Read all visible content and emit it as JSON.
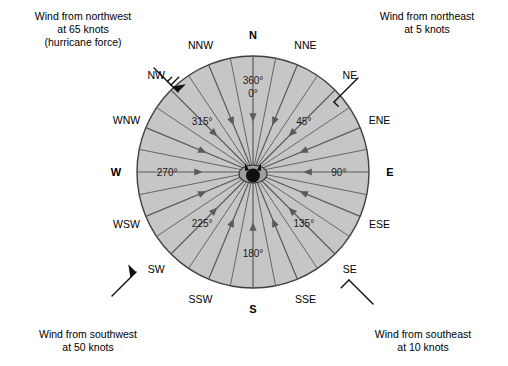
{
  "figure": {
    "kind": "wind-rose-diagram",
    "background_color": "#ffffff",
    "circle_fill_color": "#c6c6c6",
    "circle_edge_color": "#3f3f3f",
    "spoke_color": "#5a5a5a",
    "text_color": "#000000"
  },
  "rose": {
    "center_x": 253,
    "center_y": 172,
    "radius": 116,
    "compass_points": [
      {
        "label": "N",
        "bearing": 0,
        "cardinal": true
      },
      {
        "label": "NNE",
        "bearing": 22.5,
        "cardinal": false
      },
      {
        "label": "NE",
        "bearing": 45,
        "cardinal": false
      },
      {
        "label": "ENE",
        "bearing": 67.5,
        "cardinal": false
      },
      {
        "label": "E",
        "bearing": 90,
        "cardinal": true
      },
      {
        "label": "ESE",
        "bearing": 112.5,
        "cardinal": false
      },
      {
        "label": "SE",
        "bearing": 135,
        "cardinal": false
      },
      {
        "label": "SSE",
        "bearing": 157.5,
        "cardinal": false
      },
      {
        "label": "S",
        "bearing": 180,
        "cardinal": true
      },
      {
        "label": "SSW",
        "bearing": 202.5,
        "cardinal": false
      },
      {
        "label": "SW",
        "bearing": 225,
        "cardinal": false
      },
      {
        "label": "WSW",
        "bearing": 247.5,
        "cardinal": false
      },
      {
        "label": "W",
        "bearing": 270,
        "cardinal": true
      },
      {
        "label": "WNW",
        "bearing": 292.5,
        "cardinal": false
      },
      {
        "label": "NW",
        "bearing": 315,
        "cardinal": false
      },
      {
        "label": "NNW",
        "bearing": 337.5,
        "cardinal": false
      }
    ],
    "degree_labels": [
      {
        "text": "360°",
        "bearing": 0,
        "radius_frac": 0.72,
        "offset_y": -8
      },
      {
        "text": "0°",
        "bearing": 0,
        "radius_frac": 0.72,
        "offset_y": 5
      },
      {
        "text": "45°",
        "bearing": 45,
        "radius_frac": 0.62,
        "offset_y": 0
      },
      {
        "text": "90°",
        "bearing": 90,
        "radius_frac": 0.74,
        "offset_y": 0
      },
      {
        "text": "135°",
        "bearing": 135,
        "radius_frac": 0.62,
        "offset_y": 0
      },
      {
        "text": "180°",
        "bearing": 180,
        "radius_frac": 0.7,
        "offset_y": 0
      },
      {
        "text": "225°",
        "bearing": 225,
        "radius_frac": 0.62,
        "offset_y": 0
      },
      {
        "text": "270°",
        "bearing": 270,
        "radius_frac": 0.74,
        "offset_y": 0
      },
      {
        "text": "315°",
        "bearing": 315,
        "radius_frac": 0.62,
        "offset_y": 0
      }
    ],
    "arrow_direction": "inward-to-center",
    "sector_count": 16,
    "station_circle": {
      "present": true,
      "description": "station plot circle at center where all wind arrows converge"
    }
  },
  "examples": {
    "northwest": {
      "text": "Wind from northwest\nat 65 knots\n(hurricane force)",
      "from_direction": "northwest",
      "speed_knots": 65,
      "barb": {
        "pennants": 1,
        "full_barbs": 1,
        "half_barbs": 1
      }
    },
    "northeast": {
      "text": "Wind from northeast\nat 5 knots",
      "from_direction": "northeast",
      "speed_knots": 5,
      "barb": {
        "pennants": 0,
        "full_barbs": 0,
        "half_barbs": 1
      }
    },
    "southwest": {
      "text": "Wind from southwest\nat 50 knots",
      "from_direction": "southwest",
      "speed_knots": 50,
      "barb": {
        "pennants": 1,
        "full_barbs": 0,
        "half_barbs": 0
      }
    },
    "southeast": {
      "text": "Wind from southeast\nat 10 knots",
      "from_direction": "southeast",
      "speed_knots": 10,
      "barb": {
        "pennants": 0,
        "full_barbs": 1,
        "half_barbs": 0
      }
    }
  }
}
